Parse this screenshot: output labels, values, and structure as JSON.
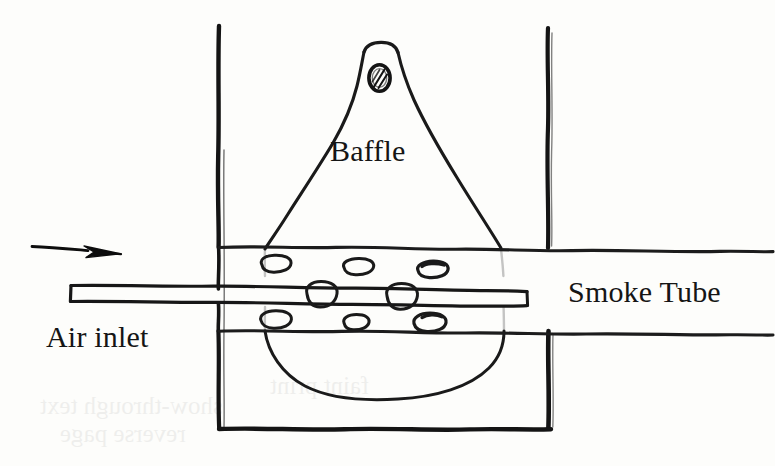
{
  "diagram": {
    "medium": "hand-drawn pen sketch on paper",
    "background_color": "#fdfdfb",
    "ink_color": "#111111",
    "labels": {
      "baffle": "Baffle",
      "air_inlet": "Air inlet",
      "smoke_tube": "Smoke Tube"
    },
    "parts": {
      "chamber_left_wall": "left wall",
      "chamber_right_wall_upper": "right wall upper",
      "chamber_right_wall_lower": "right wall lower",
      "chamber_bottom_wall": "bottom wall",
      "baffle_body": "teardrop baffle",
      "baffle_vent_hole": "hatched vent hole at baffle apex",
      "tube_upper_wall": "smoke tube upper wall",
      "tube_lower_wall": "smoke tube lower wall",
      "inner_rod": "inner rod / probe",
      "air_flow_arrow": "air flow direction arrow"
    },
    "perforations": {
      "count": 8,
      "top_row": 3,
      "middle_row": 2,
      "bottom_row": 3
    }
  },
  "bleed_through": {
    "line1": "show-through text",
    "line2": "reverse page",
    "line3": "faint print"
  }
}
